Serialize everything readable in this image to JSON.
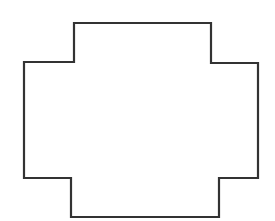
{
  "diagram": {
    "type": "rectilinear-polygon",
    "stroke_color": "#333333",
    "fill_color": "#ffffff",
    "background": "#ffffff",
    "stroke_width": 2.2,
    "points": [
      [
        74,
        23
      ],
      [
        211,
        23
      ],
      [
        211,
        63
      ],
      [
        258,
        63
      ],
      [
        258,
        178
      ],
      [
        219,
        178
      ],
      [
        219,
        217
      ],
      [
        71,
        217
      ],
      [
        71,
        178
      ],
      [
        24,
        178
      ],
      [
        24,
        62
      ],
      [
        74,
        62
      ]
    ]
  }
}
